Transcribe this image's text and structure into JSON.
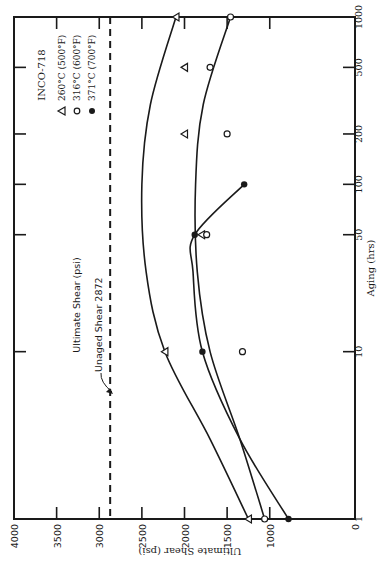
{
  "chart_data": {
    "type": "line",
    "orientation": "rotated 90 degrees counter-clockwise (page printed sideways)",
    "title": "INCO-718",
    "xlabel": "Aging (hrs)",
    "ylabel": "Ultimate Shear (psi)",
    "x_scale": "log",
    "x_ticks": [
      "1",
      "10",
      "50",
      "100",
      "200",
      "500",
      "1000"
    ],
    "x_tick_values": [
      1,
      10,
      50,
      100,
      200,
      500,
      1000
    ],
    "xlim": [
      1,
      1000
    ],
    "y_ticks": [
      "0",
      "1000",
      "1500",
      "2000",
      "2500",
      "3000",
      "3500",
      "4000"
    ],
    "y_tick_values": [
      0,
      1000,
      1500,
      2000,
      2500,
      3000,
      3500,
      4000
    ],
    "ylim": [
      0,
      4000
    ],
    "grid": false,
    "legend_position": "upper-left (rotated view), inside plot",
    "legend": [
      {
        "marker": "open-triangle",
        "label": "260°C (500°F)"
      },
      {
        "marker": "open-circle",
        "label": "316°C (600°F)"
      },
      {
        "marker": "filled-circle",
        "label": "371°C (700°F)"
      }
    ],
    "reference_line": {
      "label": "Unaged Shear 2872",
      "value": 2872,
      "style": "dashed"
    },
    "inner_label": "Ultimate Shear (psi)",
    "series": [
      {
        "name": "260°C (500°F)",
        "marker": "open-triangle",
        "points": [
          [
            1,
            1250
          ],
          [
            10,
            2230
          ],
          [
            50,
            1800
          ],
          [
            200,
            2000
          ],
          [
            500,
            2000
          ],
          [
            1000,
            2100
          ]
        ],
        "fit_curve": [
          [
            1,
            1250
          ],
          [
            3,
            1700
          ],
          [
            10,
            2230
          ],
          [
            30,
            2450
          ],
          [
            100,
            2500
          ],
          [
            300,
            2400
          ],
          [
            1000,
            2100
          ]
        ]
      },
      {
        "name": "316°C (600°F)",
        "marker": "open-circle",
        "points": [
          [
            1,
            1060
          ],
          [
            10,
            1320
          ],
          [
            50,
            1740
          ],
          [
            200,
            1500
          ],
          [
            500,
            1700
          ],
          [
            1000,
            1460
          ]
        ],
        "fit_curve": [
          [
            1,
            1060
          ],
          [
            3,
            1350
          ],
          [
            10,
            1700
          ],
          [
            30,
            1850
          ],
          [
            100,
            1870
          ],
          [
            300,
            1780
          ],
          [
            1000,
            1460
          ]
        ]
      },
      {
        "name": "371°C (700°F)",
        "marker": "filled-circle",
        "points": [
          [
            1,
            780
          ],
          [
            10,
            1790
          ],
          [
            50,
            1880
          ],
          [
            100,
            1300
          ]
        ],
        "fit_curve": [
          [
            1,
            780
          ],
          [
            3,
            1350
          ],
          [
            10,
            1790
          ],
          [
            30,
            1900
          ],
          [
            50,
            1880
          ],
          [
            100,
            1300
          ]
        ]
      }
    ]
  }
}
